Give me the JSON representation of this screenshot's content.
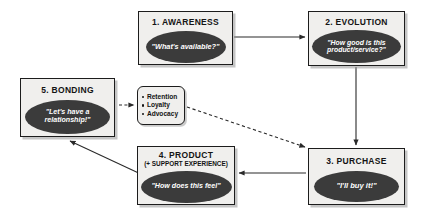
{
  "diagram": {
    "colors": {
      "box_fill": "#f0efed",
      "box_border": "#1c1c1c",
      "bubble_fill": "#3b3b3b",
      "bubble_text": "#ffffff",
      "edge": "#2a2a2a",
      "background": "#ffffff"
    },
    "nodes": [
      {
        "id": "awareness",
        "title": "1.  AWARENESS",
        "subtitle": "",
        "quote": "\"What's available?\""
      },
      {
        "id": "evolution",
        "title": "2.  EVOLUTION",
        "subtitle": "",
        "quote": "\"How good is this product/service?\""
      },
      {
        "id": "purchase",
        "title": "3.  PURCHASE",
        "subtitle": "",
        "quote": "\"I'll buy it!\""
      },
      {
        "id": "product",
        "title": "4.  PRODUCT",
        "subtitle": "(+ SUPPORT EXPERIENCE)",
        "quote": "\"How does this feel\""
      },
      {
        "id": "bonding",
        "title": "5.  BONDING",
        "subtitle": "",
        "quote": "\"Let's have a relationship!\""
      }
    ],
    "benefits": {
      "items": [
        "Retention",
        "Loyalty",
        "Advocacy"
      ]
    },
    "edges": [
      {
        "from": "awareness",
        "to": "evolution",
        "style": "solid",
        "direction": "right"
      },
      {
        "from": "evolution",
        "to": "purchase",
        "style": "solid",
        "direction": "down"
      },
      {
        "from": "purchase",
        "to": "product",
        "style": "solid",
        "direction": "left"
      },
      {
        "from": "product",
        "to": "bonding",
        "style": "solid",
        "direction": "up-left"
      },
      {
        "from": "bonding",
        "to": "benefits",
        "style": "dashed",
        "direction": "right"
      },
      {
        "from": "benefits",
        "to": "purchase",
        "style": "dashed",
        "direction": "down-right"
      }
    ]
  }
}
